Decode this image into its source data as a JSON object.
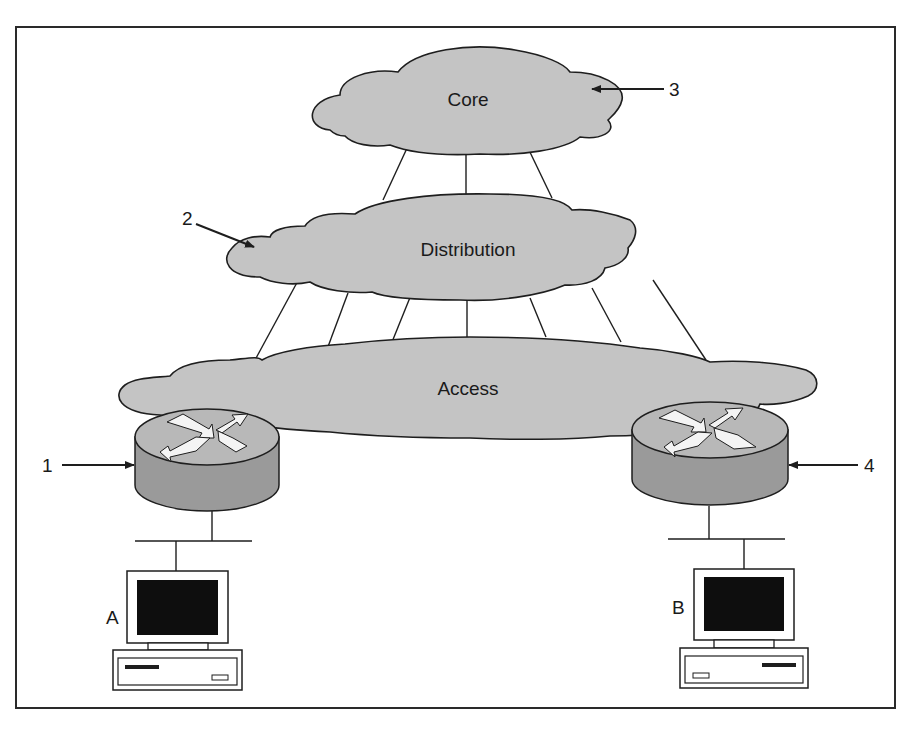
{
  "figure": {
    "frame": {
      "stroke": "#2a2a2a",
      "background": "#ffffff"
    },
    "layers": [
      {
        "id": "core",
        "label": "Core",
        "callout": "3"
      },
      {
        "id": "distribution",
        "label": "Distribution",
        "callout": "2"
      },
      {
        "id": "access",
        "label": "Access"
      }
    ],
    "routers": [
      {
        "id": "router-left",
        "callout": "1"
      },
      {
        "id": "router-right",
        "callout": "4"
      }
    ],
    "hosts": [
      {
        "id": "host-a",
        "label": "A"
      },
      {
        "id": "host-b",
        "label": "B"
      }
    ],
    "links": {
      "core_to_distribution": 3,
      "distribution_to_access": 7
    },
    "colors": {
      "cloud_fill": "#c4c4c4",
      "router_top": "#b8b8b8",
      "router_side": "#9a9a9a",
      "arrow_fill": "#f4f4f4",
      "line": "#1e1e1e",
      "screen": "#0e0e0e"
    }
  }
}
